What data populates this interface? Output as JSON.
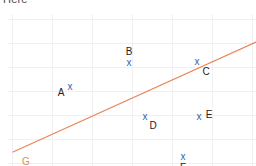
{
  "caption": "Here",
  "chart_data": {
    "type": "scatter",
    "title": "",
    "xlabel": "",
    "ylabel": "",
    "grid": true,
    "legend_position": "none",
    "xlim": [
      0,
      248
    ],
    "ylim": [
      0,
      152
    ],
    "point_marker": "x",
    "point_color": "#3b5ea8",
    "label_color": "#222222",
    "grid_color": "#f0f0f3",
    "background": "#ffffff",
    "points": [
      {
        "name": "A",
        "px": 62,
        "py": 73,
        "label_dx": -9,
        "label_dy": 6
      },
      {
        "name": "B",
        "px": 121,
        "py": 49,
        "label_dx": 0,
        "label_dy": -11
      },
      {
        "name": "C",
        "px": 189,
        "py": 48,
        "label_dx": 9,
        "label_dy": 10
      },
      {
        "name": "D",
        "px": 137,
        "py": 103,
        "label_dx": 8,
        "label_dy": 9
      },
      {
        "name": "E",
        "px": 191,
        "py": 103,
        "label_dx": 10,
        "label_dy": -2
      },
      {
        "name": "F",
        "px": 175,
        "py": 143,
        "label_dx": 0,
        "label_dy": 11
      }
    ],
    "trend_line": {
      "name": "G",
      "color": "#e8875a",
      "x1": 5,
      "y1": 138,
      "x2": 248,
      "y2": 28,
      "label": "G",
      "label_x": 18,
      "label_y": 148,
      "label_color": "#e8875a"
    },
    "grid_vertical_x": [
      4,
      44,
      84,
      124,
      164,
      204,
      244
    ],
    "grid_horizontal_y": [
      5,
      29,
      53,
      77,
      101,
      125,
      149
    ]
  }
}
